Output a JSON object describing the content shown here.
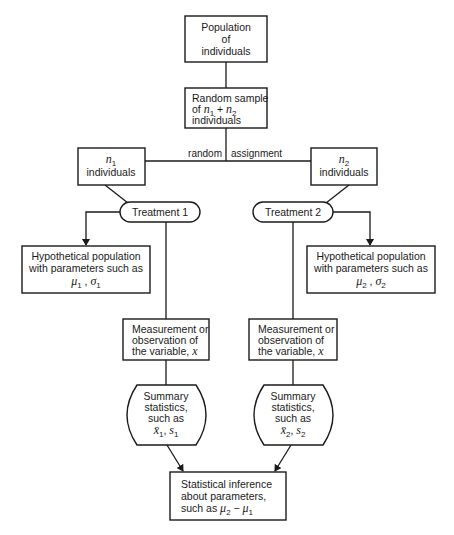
{
  "diagram": {
    "population": {
      "lines": [
        "Population",
        "of",
        "individuals"
      ]
    },
    "random_sample": {
      "line1": "Random sample",
      "line2_prefix": "of ",
      "n1": "n",
      "n1_sub": "1",
      "plus": " + ",
      "n2": "n",
      "n2_sub": "2",
      "line3": "individuals"
    },
    "assignment_label": {
      "left": "random",
      "right": "assignment"
    },
    "group1": {
      "n": "n",
      "n_sub": "1",
      "label": "individuals"
    },
    "group2": {
      "n": "n",
      "n_sub": "2",
      "label": "individuals"
    },
    "treatment1": {
      "label": "Treatment 1"
    },
    "treatment2": {
      "label": "Treatment 2"
    },
    "hyp_pop1": {
      "line1": "Hypothetical population",
      "line2": "with parameters such as",
      "mu": "μ",
      "mu_sub": "1",
      "sep": " ,  ",
      "sigma": "σ",
      "sigma_sub": "1"
    },
    "hyp_pop2": {
      "line1": "Hypothetical population",
      "line2": "with parameters such as",
      "mu": "μ",
      "mu_sub": "2",
      "sep": " ,  ",
      "sigma": "σ",
      "sigma_sub": "2"
    },
    "measure1": {
      "line1": "Measurement or",
      "line2": "observation of",
      "line3": "the variable,",
      "var": "x"
    },
    "measure2": {
      "line1": "Measurement or",
      "line2": "observation of",
      "line3": "the variable,",
      "var": "x"
    },
    "summary1": {
      "line1": "Summary",
      "line2": "statistics,",
      "line3": "such as",
      "xbar": "x̄",
      "xbar_sub": "1",
      "s": "s",
      "s_sub": "1"
    },
    "summary2": {
      "line1": "Summary",
      "line2": "statistics,",
      "line3": "such as",
      "xbar": "x̄",
      "xbar_sub": "2",
      "s": "s",
      "s_sub": "2"
    },
    "inference": {
      "line1": "Statistical inference",
      "line2": "about parameters,",
      "line3_prefix": "such as ",
      "mu_a": "μ",
      "mu_a_sub": "2",
      "minus": " − ",
      "mu_b": "μ",
      "mu_b_sub": "1"
    }
  }
}
